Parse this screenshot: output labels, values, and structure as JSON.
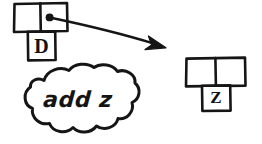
{
  "diagram": {
    "title": "add z",
    "ink_color": "#151515",
    "background_color": "#ffffff",
    "left_node": {
      "name": "left-node",
      "cells": [
        {
          "label": "",
          "has_pointer_dot": false
        },
        {
          "label": "",
          "has_pointer_dot": true
        }
      ],
      "child_label": "D"
    },
    "right_node": {
      "name": "right-node",
      "cells": [
        {
          "label": "",
          "has_pointer_dot": false
        },
        {
          "label": "",
          "has_pointer_dot": false
        }
      ],
      "child_label": "Z"
    },
    "arrow": {
      "name": "pointer-arrow",
      "from_x": 60,
      "from_y": 18,
      "to_x": 166,
      "to_y": 48
    },
    "cloud": {
      "name": "thought-cloud",
      "text": "add z"
    }
  }
}
